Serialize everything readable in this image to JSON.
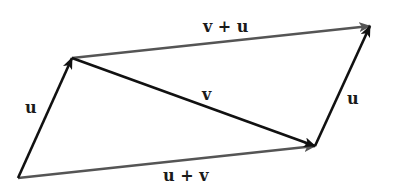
{
  "diagram": {
    "type": "vector-parallelogram",
    "colors": {
      "primary_vector": "#111111",
      "sum_vector": "#555555",
      "background": "#ffffff",
      "label": "#1a1a1a"
    },
    "points": {
      "origin": [
        18,
        178
      ],
      "u_end": [
        72,
        58
      ],
      "v_end": [
        315,
        146
      ],
      "sum_end": [
        370,
        26
      ]
    },
    "vectors": [
      {
        "id": "u-left",
        "label": "u",
        "from": "origin",
        "to": "u_end",
        "color": "primary_vector"
      },
      {
        "id": "v-diagonal",
        "label": "v",
        "from": "u_end",
        "to": "v_end",
        "color": "primary_vector"
      },
      {
        "id": "u-right",
        "label": "u",
        "from": "v_end",
        "to": "sum_end",
        "color": "primary_vector"
      },
      {
        "id": "v-plus-u",
        "label": "v + u",
        "from": "u_end",
        "to": "sum_end",
        "color": "sum_vector"
      },
      {
        "id": "u-plus-v",
        "label": "u + v",
        "from": "origin",
        "to": "v_end",
        "color": "sum_vector"
      }
    ],
    "labels": {
      "u_left": "u",
      "v_diagonal": "v",
      "u_right": "u",
      "v_plus_u": "v + u",
      "u_plus_v": "u + v"
    }
  }
}
